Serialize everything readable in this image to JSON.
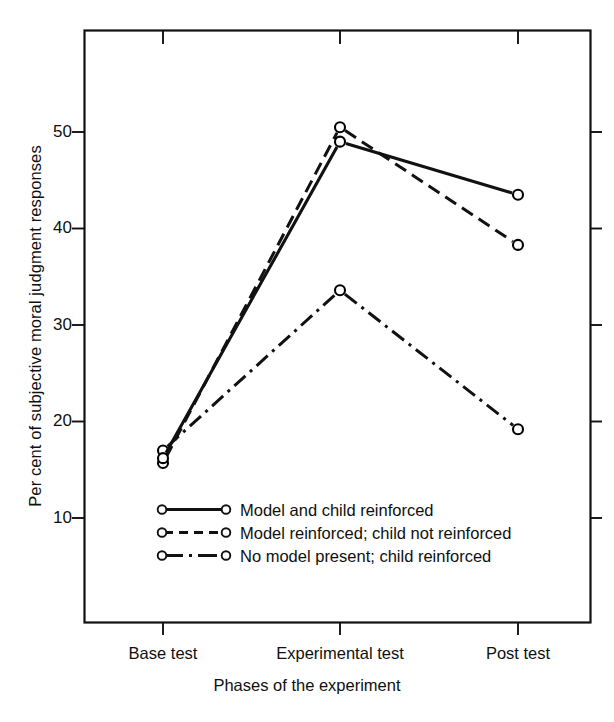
{
  "chart_data": {
    "type": "line",
    "title": "",
    "xlabel": "Phases of the experiment",
    "ylabel": "Per cent of subjective moral judgment responses",
    "categories": [
      "Base test",
      "Experimental test",
      "Post test"
    ],
    "ylim": [
      0,
      57
    ],
    "yticks": [
      10,
      20,
      30,
      40,
      50
    ],
    "ytick_labels": [
      "10",
      "20",
      "30",
      "40",
      "50"
    ],
    "grid": false,
    "legend_position": "inside-lower-left",
    "series": [
      {
        "name": "Model and child reinforced",
        "style": "solid",
        "marker": "open-circle",
        "color": "#000000",
        "values": [
          16.2,
          49.0,
          43.5
        ]
      },
      {
        "name": "Model reinforced; child not reinforced",
        "style": "dashed",
        "marker": "open-circle",
        "color": "#000000",
        "values": [
          15.7,
          50.5,
          38.3
        ]
      },
      {
        "name": "No model present; child reinforced",
        "style": "dashdot",
        "marker": "open-circle",
        "color": "#000000",
        "values": [
          17.0,
          33.6,
          19.2
        ]
      }
    ]
  },
  "axis": {
    "ytick_10": "10",
    "ytick_20": "20",
    "ytick_30": "30",
    "ytick_40": "40",
    "ytick_50": "50",
    "xtick_0": "Base test",
    "xtick_1": "Experimental test",
    "xtick_2": "Post test",
    "xlabel": "Phases of the experiment",
    "ylabel": "Per cent of subjective moral judgment responses"
  },
  "legend": {
    "item_0": "Model and child reinforced",
    "item_1": "Model reinforced; child not reinforced",
    "item_2": "No model present; child reinforced"
  }
}
